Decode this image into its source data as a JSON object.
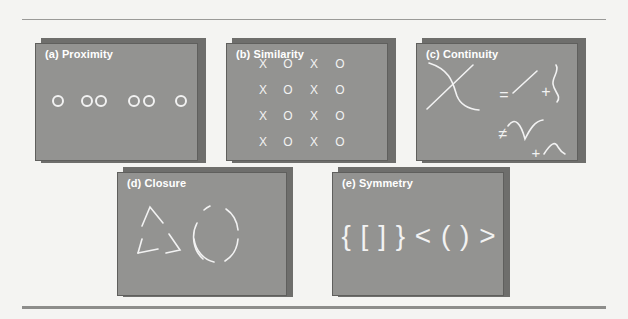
{
  "figure": {
    "panels": [
      {
        "id": "a",
        "label": "(a) Proximity",
        "content": "six circles grouped as 1, 2, 2, 1: o oo oo o"
      },
      {
        "id": "b",
        "label": "(b) Similarity",
        "grid": [
          [
            "X",
            "O",
            "X",
            "O"
          ],
          [
            "X",
            "O",
            "X",
            "O"
          ],
          [
            "X",
            "O",
            "X",
            "O"
          ],
          [
            "X",
            "O",
            "X",
            "O"
          ]
        ]
      },
      {
        "id": "c",
        "label": "(c) Continuity",
        "symbols": {
          "equals": "=",
          "plus": "+",
          "not_equals": "≠"
        }
      },
      {
        "id": "d",
        "label": "(d) Closure",
        "content": "broken triangle and broken circle"
      },
      {
        "id": "e",
        "label": "(e) Symmetry",
        "text": "{ [ ] } < ( ) >"
      }
    ]
  },
  "colors": {
    "panel_fill": "#939391",
    "panel_shadow": "#6e6e6c",
    "stroke": "#f2f2f2",
    "background": "#f4f4f2",
    "rule": "#8a8a88"
  }
}
